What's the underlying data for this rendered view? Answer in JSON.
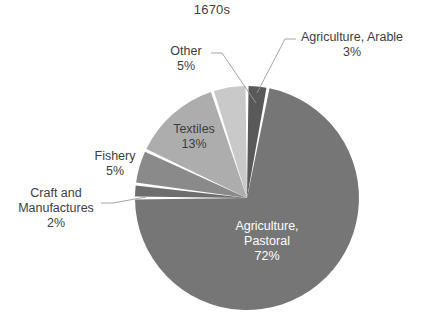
{
  "chart_data": {
    "type": "pie",
    "title": "1670s",
    "xlabel": "",
    "ylabel": "",
    "grid": false,
    "legend_position": "none",
    "labels_position": "callout",
    "categories": [
      "Agriculture, Arable",
      "Agriculture, Pastoral",
      "Craft and Manufactures",
      "Fishery",
      "Textiles",
      "Other"
    ],
    "values": [
      3,
      72,
      2,
      5,
      13,
      5
    ],
    "units": "percent",
    "slices": [
      {
        "name": "Agriculture, Arable",
        "name_line1": "Agriculture, Arable",
        "value": 3,
        "percent_label": "3%",
        "color": "#595959",
        "label_style": "outside",
        "label_color": "#3d3d3d",
        "leader_line": true
      },
      {
        "name": "Agriculture, Pastoral",
        "name_line1": "Agriculture,",
        "name_line2": "Pastoral",
        "value": 72,
        "percent_label": "72%",
        "color": "#767676",
        "label_style": "inside",
        "label_color": "#ffffff",
        "leader_line": false
      },
      {
        "name": "Craft and Manufactures",
        "name_line1": "Craft and",
        "name_line2": "Manufactures",
        "value": 2,
        "percent_label": "2%",
        "color": "#6e6e6e",
        "label_style": "outside",
        "label_color": "#3d3d3d",
        "leader_line": true
      },
      {
        "name": "Fishery",
        "name_line1": "Fishery",
        "value": 5,
        "percent_label": "5%",
        "color": "#8a8a8a",
        "label_style": "outside",
        "label_color": "#3d3d3d",
        "leader_line": false
      },
      {
        "name": "Textiles",
        "name_line1": "Textiles",
        "value": 13,
        "percent_label": "13%",
        "color": "#adadad",
        "label_style": "inside",
        "label_color": "#3d3d3d",
        "leader_line": false
      },
      {
        "name": "Other",
        "name_line1": "Other",
        "value": 5,
        "percent_label": "5%",
        "color": "#c9c9c9",
        "label_style": "outside",
        "label_color": "#3d3d3d",
        "leader_line": true
      }
    ],
    "background_color": "#ffffff",
    "separator_color": "#ffffff"
  }
}
